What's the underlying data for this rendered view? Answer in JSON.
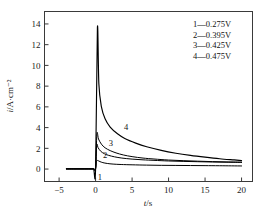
{
  "chart_data": {
    "type": "line",
    "title": "",
    "xlabel": "t/s",
    "ylabel": "i/A·cm⁻²",
    "xlim": [
      -7,
      21.5
    ],
    "ylim": [
      -1.2,
      15.2
    ],
    "xticks": [
      -5,
      0,
      5,
      10,
      15,
      20
    ],
    "xticklabels": [
      "−5",
      "0",
      "5",
      "10",
      "15",
      "20"
    ],
    "yticks": [
      0,
      2,
      4,
      6,
      8,
      10,
      12,
      14
    ],
    "yticklabels": [
      "0",
      "2",
      "4",
      "6",
      "8",
      "10",
      "12",
      "14"
    ],
    "grid": false,
    "legend_position": "upper-right",
    "series": [
      {
        "name": "1",
        "label": "1—0.275V",
        "tag": "1",
        "x": [
          -4.0,
          -3.0,
          -2.0,
          -1.0,
          -0.3,
          0.0,
          0.12,
          0.3,
          0.6,
          1.0,
          1.6,
          2.4,
          3.5,
          5.0,
          7.0,
          9.0,
          11.0,
          13.0,
          15.0,
          17.0,
          20.0
        ],
        "y": [
          0.02,
          0.02,
          0.02,
          0.02,
          0.02,
          0.05,
          0.75,
          0.82,
          0.72,
          0.62,
          0.54,
          0.48,
          0.44,
          0.41,
          0.38,
          0.36,
          0.35,
          0.34,
          0.33,
          0.32,
          0.3
        ]
      },
      {
        "name": "2",
        "label": "2—0.395V",
        "tag": "2",
        "x": [
          -4.0,
          -3.0,
          -2.0,
          -1.0,
          -0.3,
          0.0,
          0.15,
          0.35,
          0.7,
          1.2,
          1.8,
          2.6,
          3.6,
          5.0,
          6.5,
          8.0,
          10.0,
          12.0,
          14.0,
          16.0,
          18.0,
          20.0
        ],
        "y": [
          0.02,
          0.02,
          0.02,
          0.02,
          0.02,
          0.05,
          2.3,
          2.05,
          1.72,
          1.48,
          1.32,
          1.18,
          1.06,
          0.96,
          0.89,
          0.84,
          0.78,
          0.74,
          0.71,
          0.68,
          0.66,
          0.64
        ]
      },
      {
        "name": "3",
        "label": "3—0.425V",
        "tag": "3",
        "x": [
          -4.0,
          -3.0,
          -2.0,
          -1.0,
          -0.3,
          0.0,
          0.18,
          0.4,
          0.8,
          1.3,
          2.0,
          2.8,
          3.8,
          5.0,
          6.5,
          8.0,
          10.0,
          12.0,
          14.0,
          16.0,
          18.0,
          20.0
        ],
        "y": [
          0.02,
          0.02,
          0.02,
          0.02,
          0.02,
          0.05,
          3.4,
          2.9,
          2.4,
          2.05,
          1.78,
          1.56,
          1.36,
          1.2,
          1.06,
          0.97,
          0.87,
          0.81,
          0.76,
          0.72,
          0.69,
          0.67
        ]
      },
      {
        "name": "4",
        "label": "4—0.475V",
        "tag": "4",
        "x": [
          -4.0,
          -3.0,
          -2.0,
          -1.0,
          -0.3,
          0.0,
          0.25,
          0.45,
          0.8,
          1.3,
          2.0,
          3.0,
          4.0,
          5.5,
          7.0,
          9.0,
          11.0,
          13.0,
          15.0,
          17.0,
          19.0,
          20.0
        ],
        "y": [
          0.02,
          0.02,
          0.02,
          0.02,
          0.02,
          0.05,
          13.6,
          8.2,
          6.0,
          4.85,
          4.05,
          3.4,
          2.95,
          2.5,
          2.15,
          1.8,
          1.53,
          1.32,
          1.15,
          1.0,
          0.88,
          0.82
        ]
      }
    ],
    "peak": {
      "series": "4",
      "x": 0.25,
      "y": 13.6
    },
    "annotations": [
      {
        "text": "1",
        "x": 0.6,
        "y": -0.75
      },
      {
        "text": "2",
        "x": 1.3,
        "y": 1.32
      },
      {
        "text": "3",
        "x": 2.1,
        "y": 2.55
      },
      {
        "text": "4",
        "x": 4.2,
        "y": 4.05
      }
    ]
  },
  "legend": {
    "entries": [
      {
        "marker": "1",
        "dash": "—",
        "value": "0.275V",
        "text": "1—0.275V"
      },
      {
        "marker": "2",
        "dash": "—",
        "value": "0.395V",
        "text": "2—0.395V"
      },
      {
        "marker": "3",
        "dash": "—",
        "value": "0.425V",
        "text": "3—0.425V"
      },
      {
        "marker": "4",
        "dash": "—",
        "value": "0.475V",
        "text": "4—0.475V"
      }
    ]
  },
  "axes": {
    "x_title": "t/s",
    "x_title_var": "t",
    "x_title_rest": "/s",
    "y_title": "i/A·cm⁻²",
    "y_title_var": "i",
    "y_title_rest": "/A·cm⁻²"
  },
  "style": {
    "curve_color": "#000000",
    "frame_color": "#3a3a3a",
    "text_color": "#1a1a1a",
    "background": "#ffffff"
  }
}
